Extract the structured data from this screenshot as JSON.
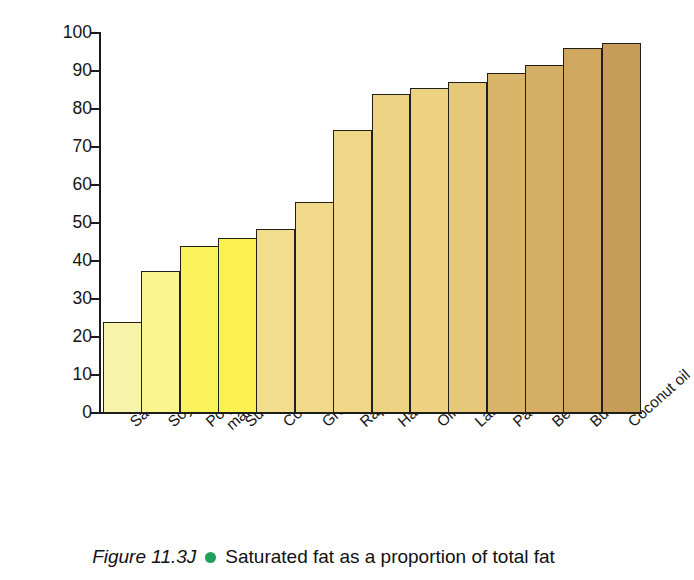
{
  "figure": {
    "caption_figure_number": "Figure 11.3J",
    "caption_text": "Saturated fat as a proportion of total fat",
    "caption_bullet_color": "#22a05a"
  },
  "axes": {
    "y_title": "Percentage of saturated fats",
    "y_ticks": [
      "0",
      "10",
      "20",
      "30",
      "40",
      "50",
      "60",
      "70",
      "80",
      "90",
      "100"
    ]
  },
  "chart_data": {
    "type": "bar",
    "title": "Saturated fat as a proportion of total fat",
    "xlabel": "",
    "ylabel": "Percentage of saturated fats",
    "ylim": [
      0,
      100
    ],
    "ytick_step": 10,
    "grid": false,
    "legend": false,
    "categories": [
      "Safflower oil",
      "Soyabean oil",
      "Polyunsaturated margarine",
      "Sunflower oil",
      "Corn oil",
      "Groundnut oil",
      "Rapeseed oil",
      "Hard margarine",
      "Olive oil",
      "Lard",
      "Palm oil",
      "Beef fat",
      "Butter",
      "Coconut oil"
    ],
    "category_lines": [
      [
        "Safflower oil"
      ],
      [
        "Soyabean oil"
      ],
      [
        "Polyunsaturated",
        "margarine"
      ],
      [
        "Sunflower oil"
      ],
      [
        "Corn oil"
      ],
      [
        "Groundnut oil"
      ],
      [
        "Rapeseed oil"
      ],
      [
        "Hard margarine"
      ],
      [
        "Olive oil"
      ],
      [
        "Lard"
      ],
      [
        "Palm oil"
      ],
      [
        "Beef fat"
      ],
      [
        "Butter"
      ],
      [
        "Coconut oil"
      ]
    ],
    "values": [
      24,
      37.5,
      44,
      46,
      48.5,
      55.5,
      74.5,
      84,
      85.5,
      87,
      89.5,
      91.5,
      96,
      97.5
    ],
    "bar_colors": [
      "#f7f3a8",
      "#fbf58e",
      "#fbf35c",
      "#fbf14f",
      "#f2dd8e",
      "#f0d98a",
      "#eed787",
      "#edd484",
      "#ecd281",
      "#e6c87a",
      "#d9b56a",
      "#d4ae64",
      "#cfa75f",
      "#c79d57"
    ],
    "bar_edge_color": "#20201a"
  }
}
